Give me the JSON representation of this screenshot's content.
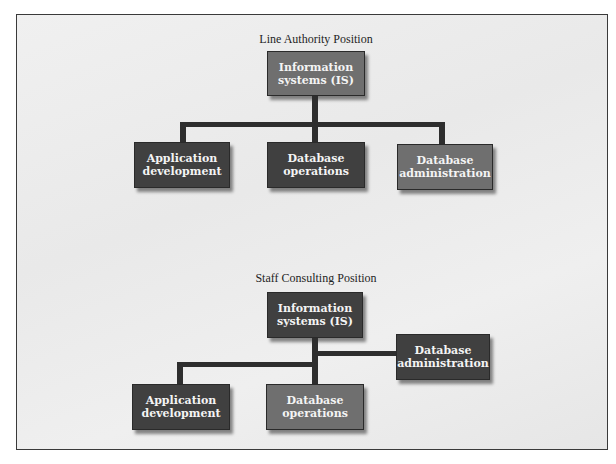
{
  "figure": {
    "line_authority": {
      "title": "Line Authority Position",
      "root": {
        "label_line1": "Information",
        "label_line2": "systems (IS)"
      },
      "children": [
        {
          "label_line1": "Application",
          "label_line2": "development"
        },
        {
          "label_line1": "Database",
          "label_line2": "operations"
        },
        {
          "label_line1": "Database",
          "label_line2": "administration"
        }
      ]
    },
    "staff_consulting": {
      "title": "Staff Consulting Position",
      "root": {
        "label_line1": "Information",
        "label_line2": "systems (IS)"
      },
      "staff": {
        "label_line1": "Database",
        "label_line2": "administration"
      },
      "children": [
        {
          "label_line1": "Application",
          "label_line2": "development"
        },
        {
          "label_line1": "Database",
          "label_line2": "operations"
        }
      ]
    }
  },
  "colors": {
    "dark_box": "#404040",
    "mid_box": "#6f6f6f",
    "line": "#2e2e2e",
    "background": "#ececec"
  }
}
